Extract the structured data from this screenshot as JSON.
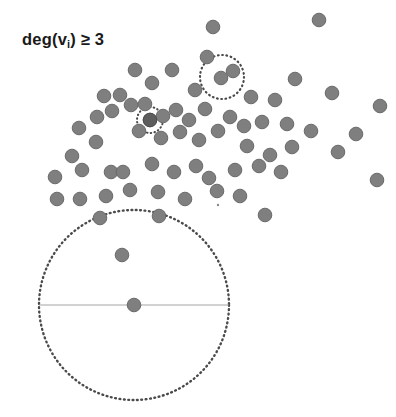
{
  "figure": {
    "title_label": "deg(v",
    "label_subscript": "i",
    "label_suffix": ") ≥ 3",
    "background_color": "#ffffff",
    "node_color": "#7f7f7f",
    "node_dark_color": "#5d5d5d",
    "ball_stroke_color": "#4a4a4a",
    "radius_line_color": "#9a9a9a"
  },
  "chart_data": {
    "type": "scatter",
    "xlabel": "",
    "ylabel": "",
    "xlim": [
      0,
      396
    ],
    "ylim": [
      0,
      417
    ],
    "grid": false,
    "legend_position": "none",
    "node_radius": 6.8,
    "series": [
      {
        "name": "graph-nodes",
        "color": "#7f7f7f",
        "points": [
          [
            213,
            27
          ],
          [
            319,
            20
          ],
          [
            135,
            70
          ],
          [
            172,
            70
          ],
          [
            207,
            57
          ],
          [
            233,
            71
          ],
          [
            295,
            79
          ],
          [
            332,
            93
          ],
          [
            380,
            106
          ],
          [
            104,
            96
          ],
          [
            120,
            95
          ],
          [
            152,
            83
          ],
          [
            195,
            90
          ],
          [
            221,
            78
          ],
          [
            251,
            97
          ],
          [
            275,
            100
          ],
          [
            79,
            128
          ],
          [
            97,
            117
          ],
          [
            112,
            111
          ],
          [
            131,
            105
          ],
          [
            145,
            104
          ],
          [
            150,
            120
          ],
          [
            163,
            116
          ],
          [
            176,
            110
          ],
          [
            189,
            120
          ],
          [
            205,
            109
          ],
          [
            230,
            117
          ],
          [
            244,
            126
          ],
          [
            262,
            122
          ],
          [
            287,
            124
          ],
          [
            311,
            131
          ],
          [
            356,
            134
          ],
          [
            72,
            156
          ],
          [
            96,
            142
          ],
          [
            139,
            131
          ],
          [
            161,
            138
          ],
          [
            180,
            132
          ],
          [
            199,
            140
          ],
          [
            218,
            131
          ],
          [
            247,
            146
          ],
          [
            270,
            155
          ],
          [
            292,
            147
          ],
          [
            338,
            152
          ],
          [
            377,
            180
          ],
          [
            55,
            177
          ],
          [
            82,
            170
          ],
          [
            111,
            172
          ],
          [
            123,
            172
          ],
          [
            152,
            164
          ],
          [
            174,
            172
          ],
          [
            196,
            166
          ],
          [
            209,
            178
          ],
          [
            235,
            170
          ],
          [
            259,
            166
          ],
          [
            281,
            172
          ],
          [
            57,
            199
          ],
          [
            80,
            199
          ],
          [
            106,
            196
          ],
          [
            130,
            190
          ],
          [
            158,
            192
          ],
          [
            185,
            199
          ],
          [
            217,
            191
          ],
          [
            240,
            196
          ],
          [
            265,
            215
          ],
          [
            100,
            218
          ],
          [
            159,
            216
          ],
          [
            122,
            255
          ],
          [
            134,
            305
          ]
        ]
      },
      {
        "name": "highlighted-node",
        "color": "#5d5d5d",
        "points": [
          [
            150,
            120
          ]
        ]
      }
    ],
    "annotations": [
      {
        "name": "ball-small",
        "shape": "dotted-circle",
        "center": [
          150,
          120
        ],
        "radius": 13
      },
      {
        "name": "ball-medium",
        "shape": "dotted-circle",
        "center": [
          222,
          77
        ],
        "radius": 22
      },
      {
        "name": "ball-large",
        "shape": "dotted-circle",
        "center": [
          134,
          305
        ],
        "radius": 95
      },
      {
        "name": "radius-line",
        "shape": "line",
        "from": [
          39,
          305
        ],
        "to": [
          229,
          305
        ]
      },
      {
        "name": "speck",
        "shape": "dot",
        "center": [
          218,
          205
        ],
        "radius": 1.2
      }
    ]
  }
}
